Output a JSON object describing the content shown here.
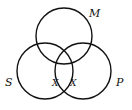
{
  "diagram": {
    "type": "venn",
    "stroke_color": "#111111",
    "circles": [
      {
        "label": "M",
        "cx": 64,
        "cy": 36,
        "r": 28
      },
      {
        "label": "S",
        "cx": 45,
        "cy": 71,
        "r": 28
      },
      {
        "label": "P",
        "cx": 83,
        "cy": 71,
        "r": 28
      }
    ],
    "labels": {
      "m": "M",
      "s": "S",
      "p": "P",
      "x_left": "X",
      "x_right": "X"
    }
  }
}
